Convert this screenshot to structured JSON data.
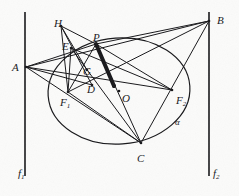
{
  "figure": {
    "background_color": "#fbfbfa",
    "ink_color": "#17171a",
    "width": 239,
    "height": 196
  },
  "conic": {
    "name": "alpha",
    "label": "α",
    "label_pos": [
      175,
      118
    ],
    "center": [
      119,
      91
    ],
    "rx": 71,
    "ry": 53,
    "rotation_deg": -4
  },
  "directrices": [
    {
      "name": "f1",
      "label": "f",
      "sub": "1",
      "x": 25,
      "y_top": 12,
      "y_bottom": 176,
      "label_pos": [
        18,
        168
      ]
    },
    {
      "name": "f2",
      "label": "f",
      "sub": "2",
      "x": 209,
      "y_top": 12,
      "y_bottom": 176,
      "label_pos": [
        213,
        168
      ]
    }
  ],
  "points": [
    {
      "id": "A",
      "label": "A",
      "x": 26,
      "y": 67,
      "label_pos": [
        12,
        62
      ],
      "dot": true
    },
    {
      "id": "B",
      "label": "B",
      "x": 209,
      "y": 21,
      "label_pos": [
        217,
        15
      ],
      "dot": true
    },
    {
      "id": "C",
      "label": "C",
      "x": 141,
      "y": 143,
      "label_pos": [
        137,
        153
      ],
      "dot": true
    },
    {
      "id": "H",
      "label": "H",
      "x": 61,
      "y": 26,
      "label_pos": [
        54,
        18
      ],
      "dot": true
    },
    {
      "id": "P",
      "label": "P",
      "x": 96,
      "y": 44,
      "label_pos": [
        93,
        32
      ],
      "dot": true
    },
    {
      "id": "E",
      "label": "E",
      "x": 71,
      "y": 48,
      "label_pos": [
        62,
        41
      ],
      "dot": true
    },
    {
      "id": "G",
      "label": "G",
      "x": 87,
      "y": 70,
      "label_pos": [
        83,
        66
      ],
      "dot": true
    },
    {
      "id": "D",
      "label": "D",
      "x": 92,
      "y": 85,
      "label_pos": [
        87,
        84
      ],
      "dot": true
    },
    {
      "id": "F1",
      "label": "F",
      "sub": "1",
      "x": 68,
      "y": 92,
      "label_pos": [
        60,
        97
      ],
      "dot": true
    },
    {
      "id": "F2",
      "label": "F",
      "sub": "2",
      "x": 172,
      "y": 90,
      "label_pos": [
        176,
        95
      ],
      "dot": true
    },
    {
      "id": "O",
      "label": "O",
      "x": 119,
      "y": 91,
      "label_pos": [
        122,
        93
      ],
      "dot": true
    }
  ],
  "segments": [
    {
      "from": "A",
      "to": "P",
      "weight": 1
    },
    {
      "from": "A",
      "to": "B",
      "weight": 1
    },
    {
      "from": "A",
      "to": "F2",
      "weight": 1
    },
    {
      "from": "A",
      "to": "C",
      "weight": 1
    },
    {
      "from": "A",
      "to": "D",
      "weight": 1
    },
    {
      "from": "H",
      "to": "P",
      "weight": 1
    },
    {
      "from": "H",
      "to": "D",
      "weight": 1
    },
    {
      "from": "H",
      "to": "F1",
      "weight": 1
    },
    {
      "from": "H",
      "to": "G",
      "weight": 1
    },
    {
      "from": "P",
      "to": "B",
      "weight": 1
    },
    {
      "from": "P",
      "to": "C",
      "weight": 1
    },
    {
      "from": "P",
      "to": "F1",
      "weight": 1
    },
    {
      "from": "P",
      "to": "F2",
      "weight": 1
    },
    {
      "from": "B",
      "to": "C",
      "weight": 1
    },
    {
      "from": "B",
      "to": "F1",
      "weight": 1
    },
    {
      "from": "C",
      "to": "E",
      "weight": 1
    },
    {
      "from": "C",
      "to": "F1",
      "weight": 1
    },
    {
      "from": "E",
      "to": "F1",
      "weight": 1
    },
    {
      "from": "E",
      "to": "F2",
      "weight": 1
    }
  ],
  "emphasis": {
    "name": "polar-wedge",
    "from": "P",
    "to": [
      114,
      86
    ],
    "through": "G",
    "weight": 4,
    "endpoint_dot": true
  }
}
